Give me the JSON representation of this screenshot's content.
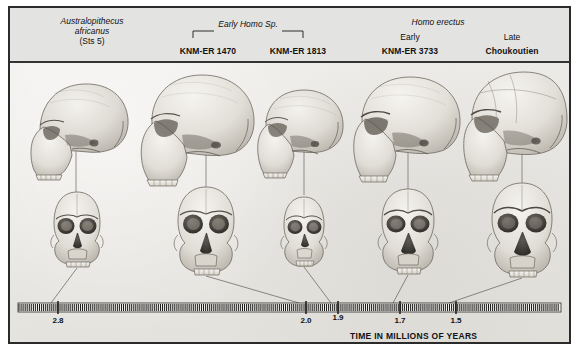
{
  "figure": {
    "title_caption": "TIME IN MILLIONS OF YEARS",
    "border_color": "#2b2b2b",
    "header_bg": "#e3e3e1",
    "plate_bg": "#eceae6"
  },
  "header": {
    "columns": [
      {
        "taxon": "Australopithecus",
        "taxon_line2": "africanus",
        "taxon_line3": "(Sts 5)",
        "specimen": "",
        "stage": ""
      },
      {
        "taxon": "",
        "specimen": "KNM-ER 1470",
        "stage": ""
      },
      {
        "taxon": "",
        "specimen": "KNM-ER 1813",
        "stage": ""
      },
      {
        "taxon": "",
        "specimen": "KNM-ER 3733",
        "stage": "Early"
      },
      {
        "taxon": "",
        "specimen": "Choukoutien",
        "stage": "Late"
      }
    ],
    "group_labels": [
      {
        "text": "Early Homo Sp.",
        "bracketed": true
      },
      {
        "text": "Homo erectus",
        "bracketed": false
      }
    ]
  },
  "chart_data": {
    "type": "table",
    "xlabel": "TIME IN MILLIONS OF YEARS",
    "axis_ticks": [
      "2.8",
      "2.0",
      "1.9",
      "1.7",
      "1.5"
    ],
    "axis_direction": "older-left-to-younger-right",
    "specimens": [
      {
        "name": "Australopithecus africanus (Sts 5)",
        "date_mya": "2.8",
        "group": "Australopithecus"
      },
      {
        "name": "KNM-ER 1470",
        "date_mya": "2.0",
        "group": "Early Homo Sp."
      },
      {
        "name": "KNM-ER 1813",
        "date_mya": "1.9",
        "group": "Early Homo Sp."
      },
      {
        "name": "KNM-ER 3733",
        "date_mya": "1.7",
        "group": "Homo erectus"
      },
      {
        "name": "Choukoutien",
        "date_mya": "1.5",
        "group": "Homo erectus"
      }
    ],
    "views_per_specimen": [
      "lateral",
      "frontal"
    ]
  },
  "axis": {
    "ticks": [
      {
        "label": "2.8",
        "x": 48
      },
      {
        "label": "2.0",
        "x": 296
      },
      {
        "label": "1.9",
        "x": 328
      },
      {
        "label": "1.7",
        "x": 390
      },
      {
        "label": "1.5",
        "x": 446
      }
    ],
    "caption": "TIME IN MILLIONS OF YEARS"
  }
}
